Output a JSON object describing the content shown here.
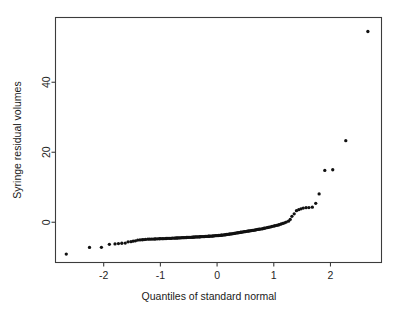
{
  "figure": {
    "background_color": "#ffffff",
    "point_color": "#111111",
    "axis_color": "#3c3c3c"
  },
  "axis": {
    "x_title": "Quantiles of standard normal",
    "y_title": "Syringe residual volumes",
    "x_ticks": [
      "-2",
      "-1",
      "0",
      "1",
      "2"
    ],
    "y_ticks": [
      "0",
      "20",
      "40"
    ]
  },
  "chart_data": {
    "type": "scatter",
    "title": "",
    "subtitle": "",
    "xlabel": "Quantiles of standard normal",
    "ylabel": "Syringe residual volumes",
    "xlim": [
      -2.85,
      2.9
    ],
    "ylim": [
      -11.5,
      58.5
    ],
    "xticks": [
      -2,
      -1,
      0,
      1,
      2
    ],
    "yticks": [
      0,
      20,
      40
    ],
    "grid": false,
    "legend": false,
    "legend_position": "none",
    "annotations": [],
    "x": [
      -2.66,
      -2.25,
      -2.04,
      -1.9,
      -1.8,
      -1.74,
      -1.68,
      -1.62,
      -1.57,
      -1.52,
      -1.48,
      -1.44,
      -1.4,
      -1.36,
      -1.32,
      -1.29,
      -1.26,
      -1.22,
      -1.19,
      -1.16,
      -1.13,
      -1.1,
      -1.08,
      -1.05,
      -1.02,
      -1.0,
      -0.97,
      -0.95,
      -0.92,
      -0.9,
      -0.88,
      -0.85,
      -0.83,
      -0.81,
      -0.79,
      -0.76,
      -0.74,
      -0.72,
      -0.7,
      -0.68,
      -0.66,
      -0.64,
      -0.62,
      -0.6,
      -0.58,
      -0.56,
      -0.54,
      -0.52,
      -0.5,
      -0.48,
      -0.46,
      -0.44,
      -0.42,
      -0.41,
      -0.39,
      -0.37,
      -0.35,
      -0.33,
      -0.31,
      -0.3,
      -0.28,
      -0.26,
      -0.24,
      -0.22,
      -0.21,
      -0.19,
      -0.17,
      -0.15,
      -0.14,
      -0.12,
      -0.1,
      -0.08,
      -0.07,
      -0.05,
      -0.03,
      -0.01,
      0.01,
      0.03,
      0.05,
      0.07,
      0.08,
      0.1,
      0.12,
      0.14,
      0.15,
      0.17,
      0.19,
      0.21,
      0.22,
      0.24,
      0.26,
      0.28,
      0.3,
      0.31,
      0.33,
      0.35,
      0.37,
      0.39,
      0.41,
      0.42,
      0.44,
      0.46,
      0.48,
      0.5,
      0.52,
      0.54,
      0.56,
      0.58,
      0.6,
      0.62,
      0.64,
      0.66,
      0.68,
      0.7,
      0.72,
      0.74,
      0.76,
      0.79,
      0.81,
      0.83,
      0.85,
      0.88,
      0.9,
      0.92,
      0.95,
      0.97,
      1.0,
      1.02,
      1.05,
      1.08,
      1.1,
      1.13,
      1.16,
      1.19,
      1.22,
      1.26,
      1.29,
      1.32,
      1.36,
      1.4,
      1.44,
      1.48,
      1.52,
      1.57,
      1.62,
      1.68,
      1.74,
      1.8,
      1.9,
      2.04,
      2.27,
      2.66
    ],
    "y": [
      -9.1,
      -7.2,
      -7.15,
      -6.3,
      -6.2,
      -6.1,
      -6.0,
      -5.95,
      -5.6,
      -5.55,
      -5.4,
      -5.3,
      -5.1,
      -5.05,
      -5.0,
      -4.95,
      -4.9,
      -4.85,
      -4.85,
      -4.8,
      -4.8,
      -4.78,
      -4.76,
      -4.74,
      -4.72,
      -4.7,
      -4.7,
      -4.68,
      -4.66,
      -4.64,
      -4.62,
      -4.6,
      -4.6,
      -4.58,
      -4.56,
      -4.54,
      -4.52,
      -4.5,
      -4.5,
      -4.48,
      -4.46,
      -4.44,
      -4.42,
      -4.4,
      -4.4,
      -4.38,
      -4.36,
      -4.34,
      -4.32,
      -4.3,
      -4.3,
      -4.28,
      -4.26,
      -4.24,
      -4.22,
      -4.2,
      -4.2,
      -4.18,
      -4.16,
      -4.14,
      -4.12,
      -4.1,
      -4.1,
      -4.08,
      -4.06,
      -4.04,
      -4.02,
      -4.0,
      -4.0,
      -3.98,
      -3.96,
      -3.94,
      -3.9,
      -3.88,
      -3.85,
      -3.82,
      -3.8,
      -3.78,
      -3.75,
      -3.72,
      -3.7,
      -3.66,
      -3.62,
      -3.58,
      -3.55,
      -3.5,
      -3.46,
      -3.42,
      -3.38,
      -3.34,
      -3.3,
      -3.25,
      -3.2,
      -3.15,
      -3.1,
      -3.05,
      -3.0,
      -2.95,
      -2.9,
      -2.85,
      -2.8,
      -2.75,
      -2.7,
      -2.65,
      -2.6,
      -2.55,
      -2.5,
      -2.45,
      -2.4,
      -2.35,
      -2.3,
      -2.25,
      -2.18,
      -2.1,
      -2.05,
      -2.0,
      -1.95,
      -1.9,
      -1.8,
      -1.72,
      -1.65,
      -1.55,
      -1.48,
      -1.4,
      -1.3,
      -1.2,
      -1.1,
      -1.0,
      -0.9,
      -0.78,
      -0.65,
      -0.5,
      -0.35,
      -0.15,
      0.05,
      0.3,
      0.8,
      1.7,
      2.4,
      3.3,
      3.6,
      3.85,
      4.05,
      4.15,
      4.2,
      4.3,
      5.4,
      8.1,
      14.8,
      15.0,
      23.3,
      54.5
    ]
  }
}
